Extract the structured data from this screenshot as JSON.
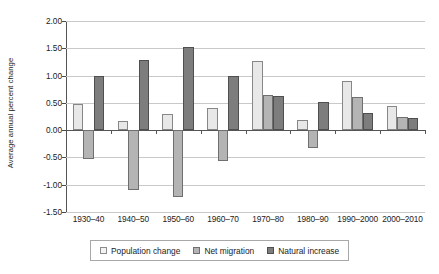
{
  "chart_data": {
    "type": "bar",
    "title": "",
    "xlabel": "",
    "ylabel": "Average annual percent change",
    "categories": [
      "1930–40",
      "1940–50",
      "1950–60",
      "1960–70",
      "1970–80",
      "1980–90",
      "1990–2000",
      "2000–2010"
    ],
    "series": [
      {
        "name": "Population change",
        "color": "#e8e8e8",
        "values": [
          0.48,
          0.17,
          0.3,
          0.41,
          1.26,
          0.19,
          0.9,
          0.45
        ]
      },
      {
        "name": "Net migration",
        "color": "#b4b4b4",
        "values": [
          -0.52,
          -1.1,
          -1.22,
          -0.57,
          0.64,
          -0.32,
          0.61,
          0.25
        ]
      },
      {
        "name": "Natural increase",
        "color": "#7d7d7d",
        "values": [
          1.0,
          1.28,
          1.53,
          1.0,
          0.62,
          0.52,
          0.31,
          0.22
        ]
      }
    ],
    "ylim": [
      -1.5,
      2.0
    ],
    "ytick_values": [
      2.0,
      1.5,
      1.0,
      0.5,
      0.0,
      -0.5,
      -1.0,
      -1.5
    ],
    "ytick_labels": [
      "2.00",
      "1.50",
      "1.00",
      "0.50",
      "0.00",
      "-0.50",
      "-1.00",
      "-1.50"
    ],
    "grid": true,
    "legend_position": "bottom",
    "zero_line": true
  },
  "legend": {
    "items": [
      {
        "label": "Population change",
        "swatch": "legend-swatch-population-change"
      },
      {
        "label": "Net migration",
        "swatch": "legend-swatch-net-migration"
      },
      {
        "label": "Natural increase",
        "swatch": "legend-swatch-natural-increase"
      }
    ]
  }
}
